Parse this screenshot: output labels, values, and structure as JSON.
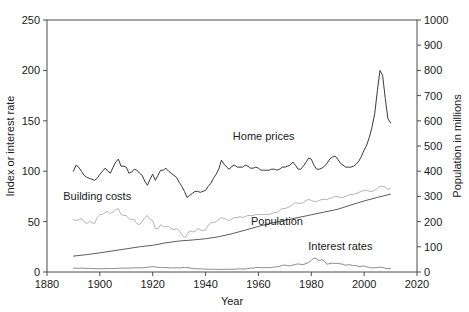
{
  "chart_data": {
    "type": "line",
    "title": "",
    "xlabel": "Year",
    "ylabel": "Index or interest rate",
    "ylabel_right": "Population in millions",
    "xlim": [
      1880,
      2020
    ],
    "ylim": [
      0,
      250
    ],
    "ylim_right": [
      0,
      1000
    ],
    "grid": false,
    "legend": "inline-annotations",
    "xticks": [
      1880,
      1900,
      1920,
      1940,
      1960,
      1980,
      2000,
      2020
    ],
    "yticks_left": [
      0,
      50,
      100,
      150,
      200,
      250
    ],
    "yticks_right": [
      0,
      100,
      200,
      300,
      400,
      500,
      600,
      700,
      800,
      900,
      1000
    ],
    "annotations": [
      {
        "text": "Home prices",
        "x": 1962,
        "y": 131
      },
      {
        "text": "Building costs",
        "x": 1899,
        "y": 71
      },
      {
        "text": "Population",
        "x": 1967,
        "y": 47
      },
      {
        "text": "Interest rates",
        "x": 1991,
        "y": 22
      }
    ],
    "series": [
      {
        "name": "Home prices",
        "axis": "left",
        "color": "#3a3a3a",
        "width": 1.0,
        "x": [
          1890,
          1891,
          1892,
          1893,
          1894,
          1895,
          1896,
          1897,
          1898,
          1899,
          1900,
          1901,
          1902,
          1903,
          1904,
          1905,
          1906,
          1907,
          1908,
          1909,
          1910,
          1911,
          1912,
          1913,
          1914,
          1915,
          1916,
          1917,
          1918,
          1919,
          1920,
          1921,
          1922,
          1923,
          1924,
          1925,
          1926,
          1927,
          1928,
          1929,
          1930,
          1931,
          1932,
          1933,
          1934,
          1935,
          1936,
          1937,
          1938,
          1939,
          1940,
          1941,
          1942,
          1943,
          1944,
          1945,
          1946,
          1947,
          1948,
          1949,
          1950,
          1951,
          1952,
          1953,
          1954,
          1955,
          1956,
          1957,
          1958,
          1959,
          1960,
          1961,
          1962,
          1963,
          1964,
          1965,
          1966,
          1967,
          1968,
          1969,
          1970,
          1971,
          1972,
          1973,
          1974,
          1975,
          1976,
          1977,
          1978,
          1979,
          1980,
          1981,
          1982,
          1983,
          1984,
          1985,
          1986,
          1987,
          1988,
          1989,
          1990,
          1991,
          1992,
          1993,
          1994,
          1995,
          1996,
          1997,
          1998,
          1999,
          2000,
          2001,
          2002,
          2003,
          2004,
          2005,
          2006,
          2007,
          2008,
          2009,
          2010
        ],
        "values": [
          100,
          106,
          104,
          100,
          96,
          94,
          93,
          92,
          91,
          93,
          97,
          100,
          103,
          100,
          98,
          104,
          109,
          112,
          105,
          105,
          104,
          98,
          99,
          102,
          101,
          98,
          96,
          90,
          86,
          92,
          97,
          91,
          96,
          101,
          101,
          103,
          100,
          98,
          96,
          94,
          89,
          85,
          80,
          74,
          76,
          78,
          80,
          80,
          79,
          80,
          81,
          85,
          88,
          93,
          97,
          102,
          111,
          107,
          104,
          102,
          105,
          106,
          104,
          104,
          104,
          106,
          105,
          103,
          103,
          104,
          103,
          101,
          101,
          101,
          101,
          102,
          102,
          101,
          102,
          104,
          104,
          105,
          106,
          109,
          106,
          102,
          102,
          105,
          109,
          113,
          112,
          106,
          102,
          102,
          103,
          105,
          108,
          112,
          114,
          115,
          112,
          108,
          106,
          104,
          104,
          104,
          105,
          107,
          110,
          115,
          121,
          126,
          134,
          144,
          157,
          180,
          200,
          195,
          172,
          152,
          148
        ]
      },
      {
        "name": "Building costs",
        "axis": "left",
        "color": "#b4b4b4",
        "width": 1.0,
        "x": [
          1890,
          1891,
          1892,
          1893,
          1894,
          1895,
          1896,
          1897,
          1898,
          1899,
          1900,
          1901,
          1902,
          1903,
          1904,
          1905,
          1906,
          1907,
          1908,
          1909,
          1910,
          1911,
          1912,
          1913,
          1914,
          1915,
          1916,
          1917,
          1918,
          1919,
          1920,
          1921,
          1922,
          1923,
          1924,
          1925,
          1926,
          1927,
          1928,
          1929,
          1930,
          1931,
          1932,
          1933,
          1934,
          1935,
          1936,
          1937,
          1938,
          1939,
          1940,
          1941,
          1942,
          1943,
          1944,
          1945,
          1946,
          1947,
          1948,
          1949,
          1950,
          1951,
          1952,
          1953,
          1954,
          1955,
          1956,
          1957,
          1958,
          1959,
          1960,
          1961,
          1962,
          1963,
          1964,
          1965,
          1966,
          1967,
          1968,
          1969,
          1970,
          1971,
          1972,
          1973,
          1974,
          1975,
          1976,
          1977,
          1978,
          1979,
          1980,
          1981,
          1982,
          1983,
          1984,
          1985,
          1986,
          1987,
          1988,
          1989,
          1990,
          1991,
          1992,
          1993,
          1994,
          1995,
          1996,
          1997,
          1998,
          1999,
          2000,
          2001,
          2002,
          2003,
          2004,
          2005,
          2006,
          2007,
          2008,
          2009,
          2010
        ],
        "values": [
          52,
          51,
          52,
          53,
          50,
          48,
          50,
          49,
          48,
          54,
          57,
          57,
          59,
          60,
          58,
          60,
          62,
          63,
          57,
          56,
          56,
          53,
          52,
          52,
          48,
          47,
          50,
          54,
          56,
          52,
          51,
          43,
          43,
          47,
          45,
          45,
          45,
          43,
          42,
          43,
          41,
          37,
          34,
          37,
          41,
          40,
          40,
          43,
          42,
          41,
          42,
          46,
          49,
          49,
          50,
          52,
          54,
          53,
          52,
          51,
          53,
          54,
          54,
          55,
          54,
          55,
          56,
          56,
          56,
          57,
          57,
          57,
          57,
          57,
          57,
          58,
          59,
          59,
          61,
          63,
          63,
          64,
          65,
          67,
          69,
          68,
          68,
          69,
          71,
          72,
          71,
          70,
          70,
          71,
          72,
          72,
          72,
          73,
          74,
          75,
          75,
          74,
          74,
          75,
          76,
          77,
          77,
          78,
          79,
          80,
          81,
          81,
          80,
          80,
          81,
          83,
          85,
          85,
          84,
          82,
          83
        ]
      },
      {
        "name": "Population",
        "axis": "right",
        "color": "#5c5c5c",
        "width": 1.0,
        "x": [
          1890,
          1895,
          1900,
          1905,
          1910,
          1915,
          1920,
          1925,
          1930,
          1935,
          1940,
          1945,
          1950,
          1955,
          1960,
          1965,
          1970,
          1975,
          1980,
          1985,
          1990,
          1995,
          2000,
          2005,
          2010
        ],
        "values": [
          63,
          69,
          76,
          84,
          92,
          100,
          106,
          116,
          123,
          127,
          132,
          140,
          152,
          166,
          181,
          194,
          205,
          216,
          227,
          238,
          249,
          266,
          282,
          296,
          309
        ]
      },
      {
        "name": "Interest rates",
        "axis": "left",
        "color": "#8c8c8c",
        "width": 1.0,
        "x": [
          1890,
          1891,
          1892,
          1893,
          1894,
          1895,
          1896,
          1897,
          1898,
          1899,
          1900,
          1901,
          1902,
          1903,
          1904,
          1905,
          1906,
          1907,
          1908,
          1909,
          1910,
          1911,
          1912,
          1913,
          1914,
          1915,
          1916,
          1917,
          1918,
          1919,
          1920,
          1921,
          1922,
          1923,
          1924,
          1925,
          1926,
          1927,
          1928,
          1929,
          1930,
          1931,
          1932,
          1933,
          1934,
          1935,
          1936,
          1937,
          1938,
          1939,
          1940,
          1941,
          1942,
          1943,
          1944,
          1945,
          1946,
          1947,
          1948,
          1949,
          1950,
          1951,
          1952,
          1953,
          1954,
          1955,
          1956,
          1957,
          1958,
          1959,
          1960,
          1961,
          1962,
          1963,
          1964,
          1965,
          1966,
          1967,
          1968,
          1969,
          1970,
          1971,
          1972,
          1973,
          1974,
          1975,
          1976,
          1977,
          1978,
          1979,
          1980,
          1981,
          1982,
          1983,
          1984,
          1985,
          1986,
          1987,
          1988,
          1989,
          1990,
          1991,
          1992,
          1993,
          1994,
          1995,
          1996,
          1997,
          1998,
          1999,
          2000,
          2001,
          2002,
          2003,
          2004,
          2005,
          2006,
          2007,
          2008,
          2009,
          2010
        ],
        "values": [
          3.8,
          3.8,
          3.7,
          3.8,
          3.7,
          3.6,
          3.6,
          3.5,
          3.4,
          3.3,
          3.3,
          3.2,
          3.3,
          3.4,
          3.4,
          3.4,
          3.5,
          3.7,
          3.8,
          3.8,
          3.9,
          3.9,
          3.9,
          4.1,
          4.1,
          4.2,
          4.1,
          4.4,
          4.8,
          4.9,
          5.3,
          5.1,
          4.6,
          4.5,
          4.4,
          4.3,
          4.2,
          4.1,
          4.0,
          4.2,
          4.1,
          4.2,
          4.5,
          4.3,
          4.0,
          3.6,
          3.3,
          3.2,
          3.2,
          3.0,
          2.8,
          2.7,
          2.7,
          2.7,
          2.7,
          2.6,
          2.5,
          2.6,
          2.8,
          2.7,
          2.6,
          2.9,
          3.0,
          3.2,
          2.9,
          3.1,
          3.4,
          3.9,
          3.8,
          4.4,
          4.4,
          4.3,
          4.3,
          4.3,
          4.3,
          4.5,
          5.0,
          5.1,
          5.7,
          6.5,
          6.9,
          6.3,
          6.2,
          6.8,
          7.6,
          8.0,
          7.6,
          7.4,
          8.4,
          9.4,
          11.5,
          13.9,
          13.0,
          11.1,
          12.4,
          10.6,
          7.7,
          8.4,
          8.8,
          8.5,
          8.6,
          8.1,
          7.7,
          6.6,
          7.4,
          6.9,
          6.4,
          6.4,
          5.3,
          5.6,
          6.0,
          5.0,
          4.6,
          4.0,
          4.3,
          4.3,
          4.8,
          4.6,
          3.7,
          3.3,
          3.2
        ]
      }
    ]
  },
  "axes": {
    "left_title": "Index or interest rate",
    "right_title": "Population in millions",
    "bottom_title": "Year"
  }
}
